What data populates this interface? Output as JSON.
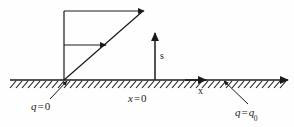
{
  "figure": {
    "type": "diagram",
    "background_color": "#fefefe",
    "stroke_color": "#1a1a1a",
    "canvas": {
      "width": 294,
      "height": 127
    },
    "ground": {
      "name": "hatched-ground-line",
      "y": 80,
      "x_start": 10,
      "x_end": 288,
      "hatch_spacing": 6,
      "hatch_length": 9,
      "hatch_angle_deg": 45
    },
    "axes": [
      {
        "id": "s",
        "label": "s",
        "orientation": "vertical",
        "origin_x": 155,
        "from_y": 80,
        "to_y": 33,
        "label_x": 160,
        "label_y": 51
      },
      {
        "id": "x",
        "label": "x",
        "orientation": "horizontal",
        "along_ground": true,
        "arrow_x": 205,
        "arrow_y": 80,
        "label_x": 198,
        "label_y": 86
      }
    ],
    "profile": {
      "name": "linear-velocity-profile",
      "wall_x": 64,
      "wall_top_y": 11,
      "wall_bottom_y": 80,
      "hypotenuse": {
        "from": [
          64,
          80
        ],
        "to": [
          143,
          11
        ]
      },
      "vectors": [
        {
          "id": "top-velocity-arrow",
          "from": [
            64,
            11
          ],
          "to": [
            143,
            11
          ]
        },
        {
          "id": "middle-velocity-arrow",
          "from": [
            64,
            45
          ],
          "to": [
            105,
            45
          ]
        }
      ]
    },
    "leaders": [
      {
        "id": "leader-q-zero",
        "from": [
          50,
          99
        ],
        "to": [
          66,
          81
        ],
        "arrow_at": "to"
      },
      {
        "id": "leader-q-q0",
        "from": [
          248,
          104
        ],
        "to": [
          224,
          81
        ],
        "arrow_at": "to"
      }
    ],
    "labels": {
      "q_zero": {
        "var": "q",
        "op": "=",
        "value": "0"
      },
      "x_zero": {
        "var": "x",
        "op": "=",
        "value": "0"
      },
      "q_q0": {
        "var": "q",
        "op": "=",
        "value": "q",
        "sub": "0"
      },
      "s_axis": "s",
      "x_axis": "x"
    }
  }
}
